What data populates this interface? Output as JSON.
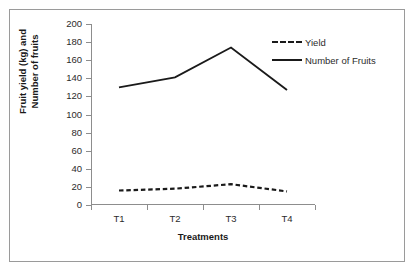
{
  "chart_data": {
    "type": "line",
    "title": "",
    "xlabel": "Treatments",
    "ylabel": "Fruit yield (kg) and Number of fruits",
    "ylabel_line1": "Fruit yield (kg) and",
    "ylabel_line2": "Number of fruits",
    "categories": [
      "T1",
      "T2",
      "T3",
      "T4"
    ],
    "ylim": [
      0,
      200
    ],
    "yticks": [
      200,
      180,
      160,
      140,
      120,
      100,
      80,
      60,
      40,
      20,
      0
    ],
    "grid": false,
    "legend_position": "top-right",
    "series": [
      {
        "name": "Yield",
        "style": "dashed",
        "color": "#1a1a1a",
        "values": [
          16,
          18,
          23,
          15
        ]
      },
      {
        "name": "Number of Fruits",
        "style": "solid",
        "color": "#1a1a1a",
        "values": [
          130,
          141,
          174,
          127
        ]
      }
    ]
  },
  "legend": {
    "items": [
      {
        "label": "Yield",
        "style": "dashed"
      },
      {
        "label": "Number of Fruits",
        "style": "solid"
      }
    ]
  }
}
